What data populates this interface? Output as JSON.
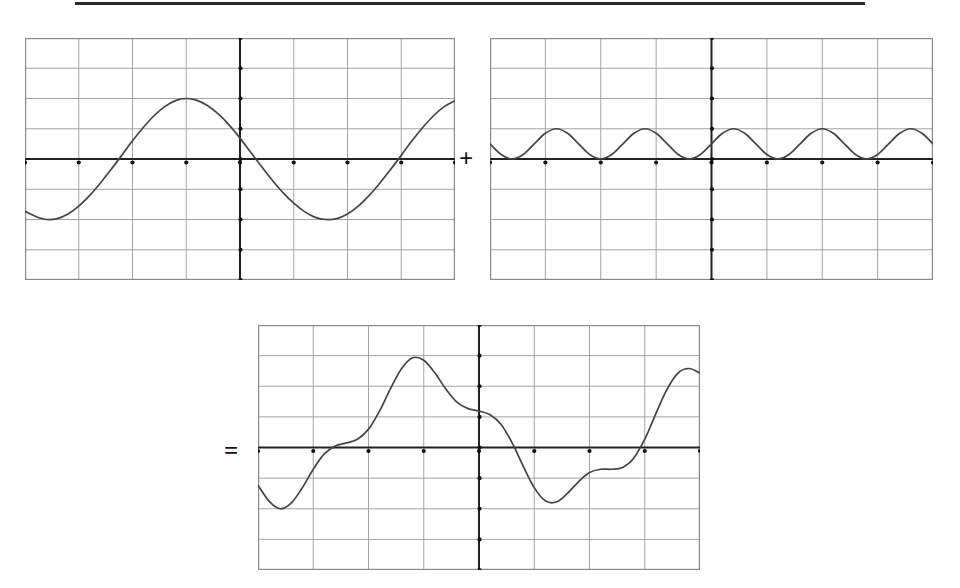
{
  "page": {
    "background_color": "#ffffff",
    "width": 960,
    "height": 588
  },
  "rule": {
    "name": "top-horizontal-rule",
    "x": 75,
    "y": 2,
    "width": 790,
    "height": 3,
    "color": "#2a2a2a"
  },
  "operators": {
    "plus": {
      "symbol": "+",
      "x": 459,
      "y": 146
    },
    "equals": {
      "symbol": "=",
      "x": 224,
      "y": 438
    }
  },
  "style": {
    "grid_color": "#9a9a9a",
    "border_color": "#8a8a8a",
    "axis_color": "#222222",
    "curve_color": "#444444",
    "tick_color": "#111111",
    "grid_line_width": 0.9,
    "axis_line_width": 2.0,
    "curve_line_width": 1.7,
    "tick_radius": 2.1
  },
  "chart_data": [
    {
      "id": "graph-1",
      "name": "first-wave-graph",
      "type": "line",
      "title": "",
      "xlabel": "",
      "ylabel": "",
      "role": "addend-1",
      "frame": {
        "x": 25,
        "y": 38,
        "width": 430,
        "height": 242
      },
      "grid": {
        "cols": 8,
        "rows": 8,
        "show": true
      },
      "axes": {
        "x_axis_row_from_top": 4,
        "y_axis_col_from_left": 4,
        "xlim": [
          -4,
          4
        ],
        "ylim": [
          -4,
          4
        ],
        "x_tick_values": [
          -4,
          -3,
          -2,
          -1,
          0,
          1,
          2,
          3,
          4
        ],
        "y_tick_values": [
          -4,
          -3,
          -2,
          -1,
          0,
          1,
          2,
          3,
          4
        ]
      },
      "function": {
        "form": "amplitude*sin(2*pi*(x - phase)/period)",
        "amplitude": 2.0,
        "period": 4.0,
        "phase": 0.3333
      },
      "series": [
        {
          "name": "sine-wave",
          "color": "#444444",
          "x": [
            -4.0,
            -3.8,
            -3.6,
            -3.4,
            -3.2,
            -3.0,
            -2.8,
            -2.6,
            -2.4,
            -2.2,
            -2.0,
            -1.8,
            -1.6,
            -1.4,
            -1.2,
            -1.0,
            -0.8,
            -0.6,
            -0.4,
            -0.2,
            0.0,
            0.2,
            0.4,
            0.6,
            0.8,
            1.0,
            1.2,
            1.4,
            1.6,
            1.8,
            2.0,
            2.2,
            2.4,
            2.6,
            2.8,
            3.0,
            3.2,
            3.4,
            3.6,
            3.8,
            4.0
          ],
          "values": [
            -1.73,
            -1.9,
            -2.0,
            -1.97,
            -1.82,
            -1.56,
            -1.21,
            -0.8,
            -0.35,
            0.12,
            0.6,
            1.04,
            1.43,
            1.73,
            1.93,
            2.0,
            1.94,
            1.76,
            1.48,
            1.12,
            0.69,
            0.22,
            -0.25,
            -0.7,
            -1.11,
            -1.46,
            -1.74,
            -1.93,
            -2.0,
            -1.97,
            -1.82,
            -1.56,
            -1.21,
            -0.8,
            -0.35,
            0.12,
            0.6,
            1.04,
            1.43,
            1.73,
            1.93
          ]
        }
      ]
    },
    {
      "id": "graph-2",
      "name": "second-wave-graph",
      "type": "line",
      "title": "",
      "xlabel": "",
      "ylabel": "",
      "role": "addend-2",
      "frame": {
        "x": 490,
        "y": 38,
        "width": 443,
        "height": 242
      },
      "grid": {
        "cols": 8,
        "rows": 8,
        "show": true
      },
      "axes": {
        "x_axis_row_from_top": 4,
        "y_axis_col_from_left": 4,
        "xlim": [
          -4,
          4
        ],
        "ylim": [
          -4,
          4
        ],
        "x_tick_values": [
          -4,
          -3,
          -2,
          -1,
          0,
          1,
          2,
          3,
          4
        ],
        "y_tick_values": [
          -4,
          -3,
          -2,
          -1,
          0,
          1,
          2,
          3,
          4
        ]
      },
      "function": {
        "form": "offset + amplitude*cos(2*pi*(x - phase)/period)",
        "offset": 0.5,
        "amplitude": 0.5,
        "period": 1.6,
        "phase": 0.0
      },
      "series": [
        {
          "name": "rectified-cosine-wave",
          "color": "#444444",
          "x": [
            -4.0,
            -3.8,
            -3.6,
            -3.4,
            -3.2,
            -3.0,
            -2.8,
            -2.6,
            -2.4,
            -2.2,
            -2.0,
            -1.8,
            -1.6,
            -1.4,
            -1.2,
            -1.0,
            -0.8,
            -0.6,
            -0.4,
            -0.2,
            0.0,
            0.2,
            0.4,
            0.6,
            0.8,
            1.0,
            1.2,
            1.4,
            1.6,
            1.8,
            2.0,
            2.2,
            2.4,
            2.6,
            2.8,
            3.0,
            3.2,
            3.4,
            3.6,
            3.8,
            4.0
          ],
          "values": [
            0.5,
            0.15,
            0.0,
            0.15,
            0.5,
            0.85,
            1.0,
            0.85,
            0.5,
            0.15,
            0.0,
            0.15,
            0.5,
            0.85,
            1.0,
            0.85,
            0.5,
            0.15,
            0.0,
            0.15,
            0.5,
            0.85,
            1.0,
            0.85,
            0.5,
            0.15,
            0.0,
            0.15,
            0.5,
            0.85,
            1.0,
            0.85,
            0.5,
            0.15,
            0.0,
            0.15,
            0.5,
            0.85,
            1.0,
            0.85,
            0.5
          ]
        }
      ]
    },
    {
      "id": "graph-3",
      "name": "sum-wave-graph",
      "type": "line",
      "title": "",
      "xlabel": "",
      "ylabel": "",
      "role": "sum",
      "frame": {
        "x": 258,
        "y": 325,
        "width": 442,
        "height": 245
      },
      "grid": {
        "cols": 8,
        "rows": 8,
        "show": true
      },
      "axes": {
        "x_axis_row_from_top": 4,
        "y_axis_col_from_left": 4,
        "xlim": [
          -4,
          4
        ],
        "ylim": [
          -4,
          4
        ],
        "x_tick_values": [
          -4,
          -3,
          -2,
          -1,
          0,
          1,
          2,
          3,
          4
        ],
        "y_tick_values": [
          -4,
          -3,
          -2,
          -1,
          0,
          1,
          2,
          3,
          4
        ]
      },
      "function": {
        "form": "graph1 + graph2"
      },
      "series": [
        {
          "name": "sum-wave",
          "color": "#444444",
          "x": [
            -4.0,
            -3.8,
            -3.6,
            -3.4,
            -3.2,
            -3.0,
            -2.8,
            -2.6,
            -2.4,
            -2.2,
            -2.0,
            -1.8,
            -1.6,
            -1.4,
            -1.2,
            -1.0,
            -0.8,
            -0.6,
            -0.4,
            -0.2,
            0.0,
            0.2,
            0.4,
            0.6,
            0.8,
            1.0,
            1.2,
            1.4,
            1.6,
            1.8,
            2.0,
            2.2,
            2.4,
            2.6,
            2.8,
            3.0,
            3.2,
            3.4,
            3.6,
            3.8,
            4.0
          ],
          "values": [
            -1.23,
            -1.75,
            -2.0,
            -1.82,
            -1.32,
            -0.71,
            -0.21,
            0.05,
            0.15,
            0.27,
            0.6,
            1.19,
            1.93,
            2.58,
            2.93,
            2.85,
            2.44,
            1.91,
            1.48,
            1.27,
            1.19,
            1.07,
            0.75,
            0.15,
            -0.61,
            -1.31,
            -1.74,
            -1.78,
            -1.5,
            -1.12,
            -0.82,
            -0.71,
            -0.71,
            -0.65,
            -0.35,
            0.27,
            1.1,
            1.89,
            2.43,
            2.58,
            2.43
          ]
        }
      ]
    }
  ]
}
